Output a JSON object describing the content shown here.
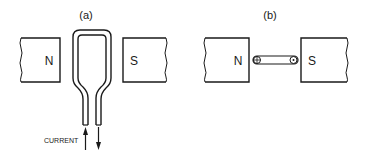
{
  "diagram": {
    "panel_a": {
      "label": "(a)",
      "magnet_left": "N",
      "magnet_right": "S",
      "current_label": "CURRENT"
    },
    "panel_b": {
      "label": "(b)",
      "magnet_left": "N",
      "magnet_right": "S"
    },
    "colors": {
      "ink": "#1a1a1a",
      "background": "#ffffff"
    }
  }
}
